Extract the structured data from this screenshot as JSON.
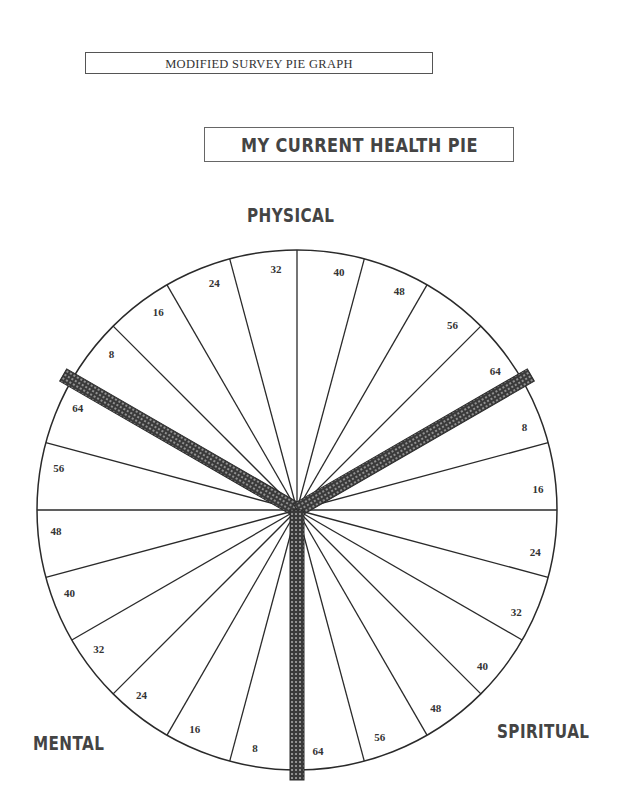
{
  "header": {
    "survey_title": "MODIFIED SURVEY PIE GRAPH",
    "chart_title": "MY CURRENT HEALTH PIE"
  },
  "sections": {
    "physical": "PHYSICAL",
    "mental": "MENTAL",
    "spiritual": "SPIRITUAL"
  },
  "scale_labels": {
    "physical": [
      "8",
      "16",
      "24",
      "32",
      "40",
      "48",
      "56",
      "64"
    ],
    "spiritual": [
      "8",
      "16",
      "24",
      "32",
      "40",
      "48",
      "56",
      "64"
    ],
    "mental": [
      "8",
      "16",
      "24",
      "32",
      "40",
      "48",
      "56",
      "64"
    ]
  },
  "colors": {
    "line": "#2a2a2a",
    "divider_bar": "#3a3a3a"
  }
}
